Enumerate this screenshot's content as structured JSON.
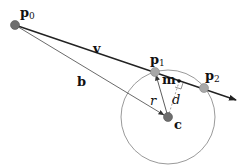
{
  "diagram": {
    "points": {
      "p0": {
        "label": "p",
        "sub": "0",
        "x": 15,
        "y": 25
      },
      "p1": {
        "label": "p",
        "sub": "1",
        "x": 155,
        "y": 72
      },
      "p2": {
        "label": "p",
        "sub": "2",
        "x": 204,
        "y": 88
      },
      "c": {
        "label": "c",
        "x": 168,
        "y": 117
      },
      "m": {
        "label": "m",
        "x": 179,
        "y": 81
      }
    },
    "vectors": {
      "v": {
        "label": "v"
      },
      "b": {
        "label": "b"
      }
    },
    "segments": {
      "r": {
        "label": "r"
      },
      "d": {
        "label": "d"
      }
    },
    "circle": {
      "cx": 168,
      "cy": 117,
      "r": 47
    },
    "colors": {
      "ray": "#222222",
      "circle": "#9a9a9a",
      "point_light": "#a8a8a8",
      "point_dark": "#6e6e6e",
      "dashed": "#888888"
    }
  }
}
